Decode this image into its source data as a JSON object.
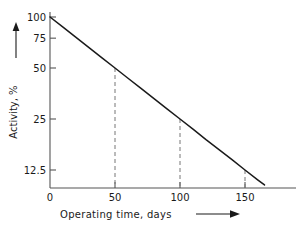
{
  "chart_data": {
    "type": "line",
    "title": "",
    "subtitle": "",
    "xlabel": "Operating time, days",
    "ylabel": "Activity, %",
    "xlabel_arrow": "right-arrow",
    "ylabel_arrow": "up-arrow",
    "grid": false,
    "legend": null,
    "xlim": [
      0,
      185
    ],
    "ylim_labels": [
      12.5,
      100
    ],
    "y_scale": "log",
    "x_ticks": [
      0,
      50,
      100,
      150
    ],
    "x_tick_labels": [
      "0",
      "50",
      "100",
      "150"
    ],
    "y_ticks": [
      100,
      75,
      50,
      25,
      12.5
    ],
    "y_tick_labels": [
      "100",
      "75",
      "50",
      "25",
      "12.5"
    ],
    "series": [
      {
        "name": "Activity decay",
        "x": [
          0,
          10,
          20,
          30,
          40,
          50,
          60,
          70,
          80,
          90,
          100,
          110,
          120,
          130,
          140,
          150,
          160,
          165
        ],
        "values": [
          100,
          87.1,
          75.8,
          66.0,
          57.4,
          50.0,
          43.5,
          37.9,
          33.0,
          28.7,
          25.0,
          21.8,
          18.9,
          16.5,
          14.4,
          12.5,
          10.9,
          10.2
        ]
      }
    ],
    "annotations": [
      {
        "type": "dashed-dropline",
        "x": 50,
        "y": 50.0,
        "label": "50"
      },
      {
        "type": "dashed-dropline",
        "x": 100,
        "y": 25.0,
        "label": "100"
      },
      {
        "type": "dashed-dropline",
        "x": 150,
        "y": 12.5,
        "label": "150"
      }
    ],
    "half_life_days": 50,
    "curve_color": "#1a1a1a",
    "axis_color": "#555555",
    "dash_color": "#777777",
    "background_color": "#ffffff"
  }
}
